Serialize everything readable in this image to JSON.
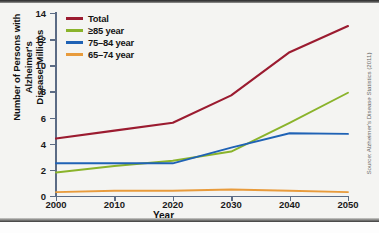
{
  "figure": {
    "source_note": "Source: Alzheimer's Disease Statistics (2011)",
    "watermark": ""
  },
  "chart_data": {
    "type": "line",
    "title": "",
    "xlabel": "Year",
    "ylabel_line1": "Number of Persons with Alzheimer's",
    "ylabel_line2": "Disease, Millions",
    "x": [
      2000,
      2010,
      2020,
      2030,
      2040,
      2050
    ],
    "xtick_labels": [
      "2000",
      "2010",
      "2020",
      "2030",
      "2040",
      "2050"
    ],
    "ytick_labels": [
      "0",
      "2",
      "4",
      "6",
      "8",
      "10",
      "12",
      "14"
    ],
    "yticks": [
      0,
      2,
      4,
      6,
      8,
      10,
      12,
      14
    ],
    "xlim": [
      2000,
      2050
    ],
    "ylim": [
      0,
      14
    ],
    "grid": false,
    "legend_position": "top-left",
    "series": [
      {
        "name": "Total",
        "color": "#9b1b30",
        "values": [
          4.4,
          5.0,
          5.6,
          7.7,
          11.0,
          13.0
        ]
      },
      {
        "name": "≥85 year",
        "color": "#8ab32b",
        "values": [
          1.8,
          2.3,
          2.7,
          3.4,
          5.6,
          7.9
        ]
      },
      {
        "name": "75–84 year",
        "color": "#1f62b5",
        "values": [
          2.5,
          2.5,
          2.5,
          3.7,
          4.8,
          4.75
        ]
      },
      {
        "name": "65–74 year",
        "color": "#e89b3c",
        "values": [
          0.3,
          0.4,
          0.4,
          0.5,
          0.4,
          0.3
        ]
      }
    ]
  }
}
